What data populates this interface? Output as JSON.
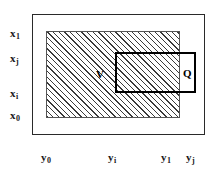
{
  "figure": {
    "vertical_axis_labels": [
      {
        "base": "x",
        "subscript": "1",
        "text": "x1",
        "top": 28
      },
      {
        "base": "x",
        "subscript": "j",
        "text": "xj",
        "top": 53
      },
      {
        "base": "x",
        "subscript": "i",
        "text": "xi",
        "top": 88
      },
      {
        "base": "x",
        "subscript": "0",
        "text": "x0",
        "top": 110
      }
    ],
    "horizontal_axis_labels": [
      {
        "base": "y",
        "subscript": "0",
        "text": "y0",
        "left": 41
      },
      {
        "base": "y",
        "subscript": "i",
        "text": "yi",
        "left": 108
      },
      {
        "base": "y",
        "subscript": "1",
        "text": "y1",
        "left": 161
      },
      {
        "base": "y",
        "subscript": "j",
        "text": "yj",
        "left": 186
      }
    ],
    "regions": {
      "outer_frame_name": "outer-frame",
      "v_label": "V",
      "q_label": "Q"
    },
    "colors": {
      "frame_stroke": "#2a2a2a",
      "hatch_stroke": "#3a3a3a",
      "q_stroke": "#000000",
      "background": "#ffffff",
      "text": "#000000"
    }
  }
}
